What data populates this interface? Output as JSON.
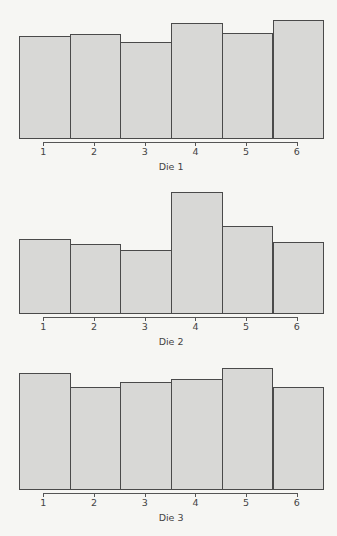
{
  "chart_data": [
    {
      "type": "bar",
      "title": "",
      "xlabel": "Die 1",
      "ylabel": "",
      "categories": [
        "1",
        "2",
        "3",
        "4",
        "5",
        "6"
      ],
      "values": [
        102,
        104,
        96,
        115,
        105,
        118
      ],
      "value_units": "relative bar height (no y-axis shown)",
      "grid": false,
      "legend": null
    },
    {
      "type": "bar",
      "title": "",
      "xlabel": "Die 2",
      "ylabel": "",
      "categories": [
        "1",
        "2",
        "3",
        "4",
        "5",
        "6"
      ],
      "values": [
        74,
        69,
        63,
        121,
        87,
        71
      ],
      "value_units": "relative bar height (no y-axis shown)",
      "grid": false,
      "legend": null
    },
    {
      "type": "bar",
      "title": "",
      "xlabel": "Die 3",
      "ylabel": "",
      "categories": [
        "1",
        "2",
        "3",
        "4",
        "5",
        "6"
      ],
      "values": [
        116,
        102,
        107,
        110,
        121,
        102
      ],
      "value_units": "relative bar height (no y-axis shown)",
      "grid": false,
      "legend": null
    }
  ],
  "style": {
    "bar_fill": "#d8d8d6",
    "bar_border": "#4a4a4a",
    "background": "#f6f6f3"
  },
  "layout": {
    "baselines": [
      138,
      313,
      488.5
    ],
    "plot_left": 19,
    "bar_width": 50.7
  }
}
